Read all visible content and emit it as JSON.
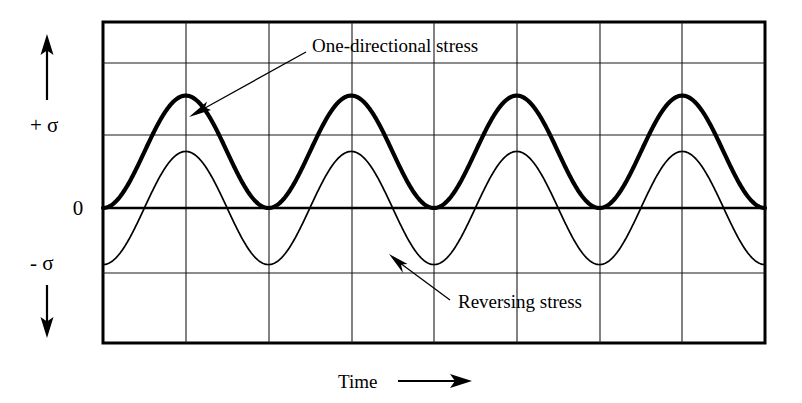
{
  "figure": {
    "background_color": "#ffffff",
    "line_color": "#000000"
  },
  "axes": {
    "y_positive_label": "+ σ",
    "y_zero_label": "0",
    "y_negative_label": "- σ",
    "y_up_arrow": "up-arrow-icon",
    "y_down_arrow": "down-arrow-icon",
    "x_label": "Time",
    "x_arrow": "right-arrow-icon"
  },
  "annotations": [
    {
      "id": "one-directional",
      "text": "One-directional stress",
      "leader_from": [
        306,
        52
      ],
      "leader_to": [
        196,
        112
      ]
    },
    {
      "id": "reversing",
      "text": "Reversing stress",
      "leader_from": [
        455,
        300
      ],
      "leader_to": [
        395,
        258
      ]
    }
  ],
  "chart_data": {
    "type": "line",
    "xlabel": "Time",
    "ylabel": "σ",
    "xlim": [
      0,
      8
    ],
    "ylim": [
      -2.25,
      2.55
    ],
    "grid": true,
    "legend": "annotated-inline",
    "y_tick_labels": [
      "+ σ",
      "0",
      "- σ"
    ],
    "y_gridlines": [
      2.55,
      2.0,
      1.0,
      0.0,
      -0.9,
      -2.25
    ],
    "x_gridlines": [
      0,
      1,
      2,
      3,
      4,
      5,
      6,
      7,
      8
    ],
    "series": [
      {
        "name": "One-directional stress",
        "style": "thick",
        "waveform": "offset-sine",
        "amplitude": 0.775,
        "offset": 0.775,
        "period": 2.0,
        "phase": 0.0,
        "min": 0.0,
        "max": 1.55,
        "cycles": 4,
        "description": "Always positive; oscillates between 0 and +1.55 (peak just above the +sigma gridline), never going below zero."
      },
      {
        "name": "Reversing stress",
        "style": "thin",
        "waveform": "sine",
        "amplitude": 0.78,
        "offset": 0.0,
        "period": 2.0,
        "phase": 0.0,
        "min": -0.78,
        "max": 0.78,
        "cycles": 4,
        "description": "Fully reversing; oscillates symmetrically between -0.78 and +0.78 about zero, in phase with the one-directional curve."
      }
    ],
    "x": [
      0,
      0.5,
      1.0,
      1.5,
      2.0,
      2.5,
      3.0,
      3.5,
      4.0,
      4.5,
      5.0,
      5.5,
      6.0,
      6.5,
      7.0,
      7.5,
      8.0
    ],
    "values_one_directional": [
      0,
      1.55,
      0,
      1.55,
      0,
      1.55,
      0,
      1.55,
      0,
      1.55,
      0,
      1.55,
      0,
      1.55,
      0,
      1.55,
      0
    ],
    "values_reversing": [
      0,
      0.78,
      0,
      -0.78,
      0,
      0.78,
      0,
      -0.78,
      0,
      0.78,
      0,
      -0.78,
      0,
      0.78,
      0,
      -0.78,
      0
    ]
  }
}
